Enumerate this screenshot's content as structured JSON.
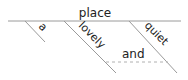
{
  "diagram": {
    "type": "sentence-diagram",
    "head": "place",
    "modifiers": [
      {
        "word": "a"
      },
      {
        "word": "lovely"
      },
      {
        "word": "quiet"
      }
    ],
    "conjunction": "and",
    "colors": {
      "line": "#9a9a9a",
      "text": "#222222",
      "dashed": "#b0b0b0"
    }
  }
}
